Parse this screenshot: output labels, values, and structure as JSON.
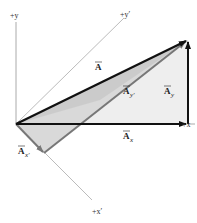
{
  "diagram": {
    "axes": {
      "y": "+y",
      "y_prime": "+y′",
      "x": "+x",
      "x_prime": "+x′"
    },
    "vectors": {
      "A": {
        "label": "A",
        "arrow": "→"
      },
      "Ax": {
        "label": "A",
        "sub": "x"
      },
      "Ay": {
        "label": "A",
        "sub": "y"
      },
      "Ax_prime": {
        "label": "A",
        "sub": "x′"
      },
      "Ay_prime": {
        "label": "A",
        "sub": "y′"
      }
    },
    "colors": {
      "axis": "#aaaaaa",
      "vector": "#111111",
      "prime_vector": "#777777",
      "light_fill": "#eeeeee",
      "dark_fill": "#c8c8c8"
    }
  }
}
